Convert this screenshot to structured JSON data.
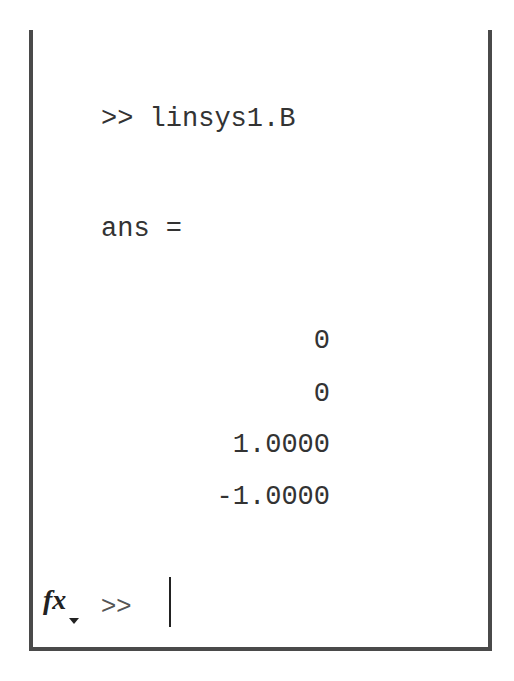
{
  "window": {
    "title": "Command Window",
    "menu_icon": "circle-chevron-down-icon"
  },
  "history": {
    "prompt": ">>",
    "command": "linsys1.B",
    "result_label": "ans =",
    "values": [
      "0",
      "0",
      "1.0000",
      "-1.0000"
    ]
  },
  "input": {
    "fx_label": "fx",
    "prompt": ">>",
    "value": ""
  }
}
